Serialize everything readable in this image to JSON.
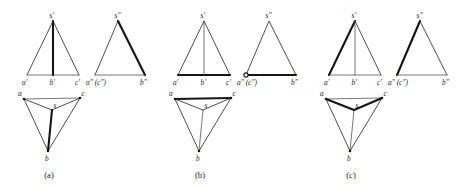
{
  "figure": {
    "background_color": "#ffffff",
    "line_color": "#3a3a3a",
    "bold_line_color": "#151515",
    "label_color": "#1d1d1d",
    "groups": [
      {
        "caption": "(a)",
        "front_view": {
          "apex_label": "s'",
          "left_label": "a'",
          "mid_label": "b'",
          "right_label": "c'",
          "bold_edges": "s'b'"
        },
        "side_view": {
          "apex_label": "s\"",
          "left_label": "a\" (c\")",
          "right_label": "b\"",
          "bold_edges": "s\"b\""
        },
        "top_view": {
          "left_label": "a",
          "center_label": "s",
          "right_label": "c",
          "bottom_label": "b",
          "bold_edges": "sb"
        }
      },
      {
        "caption": "(b)",
        "front_view": {
          "apex_label": "s'",
          "left_label": "a'",
          "mid_label": "b'",
          "right_label": "c'",
          "bold_edges": "a'c'"
        },
        "side_view": {
          "apex_label": "s\"",
          "left_label": "a\" (c\")",
          "right_label": "b\"",
          "bold_edges": "a\"b\""
        },
        "top_view": {
          "left_label": "a",
          "center_label": "s",
          "right_label": "c",
          "bottom_label": "b",
          "bold_edges": "ac"
        }
      },
      {
        "caption": "(c)",
        "front_view": {
          "apex_label": "s'",
          "left_label": "a'",
          "mid_label": "b'",
          "right_label": "c'",
          "bold_edges": "a's'"
        },
        "side_view": {
          "apex_label": "s\"",
          "left_label": "a\" (c\")",
          "right_label": "b\"",
          "bold_edges": "a\"s\""
        },
        "top_view": {
          "left_label": "a",
          "center_label": "s",
          "right_label": "c",
          "bottom_label": "b",
          "bold_edges": "as, cs"
        }
      }
    ]
  }
}
